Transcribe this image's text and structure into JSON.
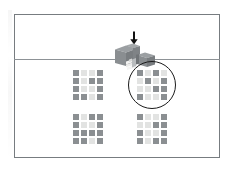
{
  "figure": {
    "kind": "spatial-reasoning-item",
    "caption": "",
    "frame_color": "#777c80",
    "divider_color": "#8d9296",
    "cell_dark_color": "#8b8f92",
    "cell_light_color": "#e2e3e2",
    "selection_color": "#1b1b1b"
  },
  "stimulus": {
    "label": "",
    "arrow": {
      "icon": "down-arrow-icon",
      "direction": "down",
      "meaning": "viewing direction"
    },
    "block_figure": {
      "icon": "isometric-block-stack-icon",
      "description": "shaded three-dimensional arrangement of stacked cubes with a stepped staircase face"
    }
  },
  "options": {
    "grid_rows": 4,
    "grid_cols": 4,
    "selected": "b",
    "items": [
      {
        "id": "a",
        "label": "",
        "selected": false,
        "cells": [
          [
            "dark",
            "light",
            "light",
            "dark"
          ],
          [
            "dark",
            "light",
            "dark",
            "dark"
          ],
          [
            "dark",
            "light",
            "light",
            "dark"
          ],
          [
            "dark",
            "dark",
            "light",
            "dark"
          ]
        ]
      },
      {
        "id": "b",
        "label": "",
        "selected": true,
        "cells": [
          [
            "dark",
            "light",
            "dark",
            "light"
          ],
          [
            "light",
            "dark",
            "light",
            "dark"
          ],
          [
            "light",
            "light",
            "dark",
            "dark"
          ],
          [
            "dark",
            "light",
            "light",
            "dark"
          ]
        ]
      },
      {
        "id": "c",
        "label": "",
        "selected": false,
        "cells": [
          [
            "dark",
            "light",
            "dark",
            "dark"
          ],
          [
            "dark",
            "light",
            "light",
            "dark"
          ],
          [
            "dark",
            "dark",
            "dark",
            "dark"
          ],
          [
            "dark",
            "dark",
            "light",
            "dark"
          ]
        ]
      },
      {
        "id": "d",
        "label": "",
        "selected": false,
        "cells": [
          [
            "dark",
            "light",
            "light",
            "dark"
          ],
          [
            "light",
            "light",
            "dark",
            "dark"
          ],
          [
            "dark",
            "light",
            "light",
            "dark"
          ],
          [
            "dark",
            "light",
            "dark",
            "dark"
          ]
        ]
      }
    ]
  }
}
